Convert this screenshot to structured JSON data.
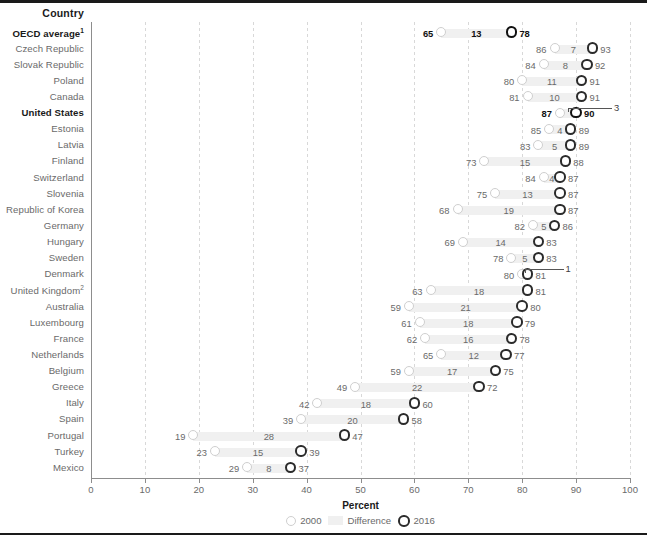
{
  "chart_data": {
    "type": "bar",
    "title": "",
    "xlabel": "Percent",
    "ylabel": "Country",
    "xlim": [
      0,
      100
    ],
    "xticks": [
      0,
      10,
      20,
      30,
      40,
      50,
      60,
      70,
      80,
      90,
      100
    ],
    "grid": true,
    "legend_position": "bottom",
    "legend": [
      {
        "key": "2000",
        "label": "2000"
      },
      {
        "key": "difference",
        "label": "Difference"
      },
      {
        "key": "2016",
        "label": "2016"
      }
    ],
    "series": [
      {
        "name": "2000",
        "values": [
          65,
          86,
          84,
          80,
          81,
          87,
          85,
          83,
          73,
          84,
          75,
          68,
          82,
          69,
          78,
          80,
          63,
          59,
          61,
          62,
          65,
          59,
          49,
          42,
          39,
          19,
          23,
          29
        ]
      },
      {
        "name": "Difference",
        "values": [
          13,
          7,
          8,
          11,
          10,
          3,
          4,
          5,
          15,
          4,
          13,
          19,
          5,
          14,
          5,
          1,
          18,
          21,
          18,
          16,
          12,
          17,
          22,
          18,
          20,
          28,
          15,
          8
        ]
      },
      {
        "name": "2016",
        "values": [
          78,
          93,
          92,
          91,
          91,
          90,
          89,
          89,
          88,
          87,
          87,
          87,
          86,
          83,
          83,
          81,
          81,
          80,
          79,
          78,
          77,
          75,
          72,
          60,
          58,
          47,
          39,
          37
        ]
      }
    ],
    "categories": [
      "OECD average",
      "Czech Republic",
      "Slovak Republic",
      "Poland",
      "Canada",
      "United States",
      "Estonia",
      "Latvia",
      "Finland",
      "Switzerland",
      "Slovenia",
      "Republic of Korea",
      "Germany",
      "Hungary",
      "Sweden",
      "Denmark",
      "United Kingdom",
      "Australia",
      "Luxembourg",
      "France",
      "Netherlands",
      "Belgium",
      "Greece",
      "Italy",
      "Spain",
      "Portugal",
      "Turkey",
      "Mexico"
    ],
    "rows": [
      {
        "country": "OECD average",
        "footnote": "1",
        "bold": true,
        "v2000": 65,
        "diff": 13,
        "v2016": 78,
        "leader": false
      },
      {
        "country": "Czech Republic",
        "footnote": "",
        "bold": false,
        "v2000": 86,
        "diff": 7,
        "v2016": 93,
        "leader": false
      },
      {
        "country": "Slovak Republic",
        "footnote": "",
        "bold": false,
        "v2000": 84,
        "diff": 8,
        "v2016": 92,
        "leader": false
      },
      {
        "country": "Poland",
        "footnote": "",
        "bold": false,
        "v2000": 80,
        "diff": 11,
        "v2016": 91,
        "leader": false
      },
      {
        "country": "Canada",
        "footnote": "",
        "bold": false,
        "v2000": 81,
        "diff": 10,
        "v2016": 91,
        "leader": false
      },
      {
        "country": "United States",
        "footnote": "",
        "bold": true,
        "v2000": 87,
        "diff": 3,
        "v2016": 90,
        "leader": true
      },
      {
        "country": "Estonia",
        "footnote": "",
        "bold": false,
        "v2000": 85,
        "diff": 4,
        "v2016": 89,
        "leader": false
      },
      {
        "country": "Latvia",
        "footnote": "",
        "bold": false,
        "v2000": 83,
        "diff": 5,
        "v2016": 89,
        "leader": false
      },
      {
        "country": "Finland",
        "footnote": "",
        "bold": false,
        "v2000": 73,
        "diff": 15,
        "v2016": 88,
        "leader": false
      },
      {
        "country": "Switzerland",
        "footnote": "",
        "bold": false,
        "v2000": 84,
        "diff": 4,
        "v2016": 87,
        "leader": false
      },
      {
        "country": "Slovenia",
        "footnote": "",
        "bold": false,
        "v2000": 75,
        "diff": 13,
        "v2016": 87,
        "leader": false
      },
      {
        "country": "Republic of Korea",
        "footnote": "",
        "bold": false,
        "v2000": 68,
        "diff": 19,
        "v2016": 87,
        "leader": false
      },
      {
        "country": "Germany",
        "footnote": "",
        "bold": false,
        "v2000": 82,
        "diff": 5,
        "v2016": 86,
        "leader": false
      },
      {
        "country": "Hungary",
        "footnote": "",
        "bold": false,
        "v2000": 69,
        "diff": 14,
        "v2016": 83,
        "leader": false
      },
      {
        "country": "Sweden",
        "footnote": "",
        "bold": false,
        "v2000": 78,
        "diff": 5,
        "v2016": 83,
        "leader": false
      },
      {
        "country": "Denmark",
        "footnote": "",
        "bold": false,
        "v2000": 80,
        "diff": 1,
        "v2016": 81,
        "leader": true
      },
      {
        "country": "United Kingdom",
        "footnote": "2",
        "bold": false,
        "v2000": 63,
        "diff": 18,
        "v2016": 81,
        "leader": false
      },
      {
        "country": "Australia",
        "footnote": "",
        "bold": false,
        "v2000": 59,
        "diff": 21,
        "v2016": 80,
        "leader": false
      },
      {
        "country": "Luxembourg",
        "footnote": "",
        "bold": false,
        "v2000": 61,
        "diff": 18,
        "v2016": 79,
        "leader": false
      },
      {
        "country": "France",
        "footnote": "",
        "bold": false,
        "v2000": 62,
        "diff": 16,
        "v2016": 78,
        "leader": false
      },
      {
        "country": "Netherlands",
        "footnote": "",
        "bold": false,
        "v2000": 65,
        "diff": 12,
        "v2016": 77,
        "leader": false
      },
      {
        "country": "Belgium",
        "footnote": "",
        "bold": false,
        "v2000": 59,
        "diff": 17,
        "v2016": 75,
        "leader": false
      },
      {
        "country": "Greece",
        "footnote": "",
        "bold": false,
        "v2000": 49,
        "diff": 22,
        "v2016": 72,
        "leader": false
      },
      {
        "country": "Italy",
        "footnote": "",
        "bold": false,
        "v2000": 42,
        "diff": 18,
        "v2016": 60,
        "leader": false
      },
      {
        "country": "Spain",
        "footnote": "",
        "bold": false,
        "v2000": 39,
        "diff": 20,
        "v2016": 58,
        "leader": false
      },
      {
        "country": "Portugal",
        "footnote": "",
        "bold": false,
        "v2000": 19,
        "diff": 28,
        "v2016": 47,
        "leader": false
      },
      {
        "country": "Turkey",
        "footnote": "",
        "bold": false,
        "v2000": 23,
        "diff": 15,
        "v2016": 39,
        "leader": false
      },
      {
        "country": "Mexico",
        "footnote": "",
        "bold": false,
        "v2000": 29,
        "diff": 8,
        "v2016": 37,
        "leader": false
      }
    ]
  },
  "header": {
    "country_column_label": "Country"
  },
  "axis": {
    "title": "Percent"
  },
  "legend": {
    "series_2000": "2000",
    "difference": "Difference",
    "series_2016": "2016"
  }
}
